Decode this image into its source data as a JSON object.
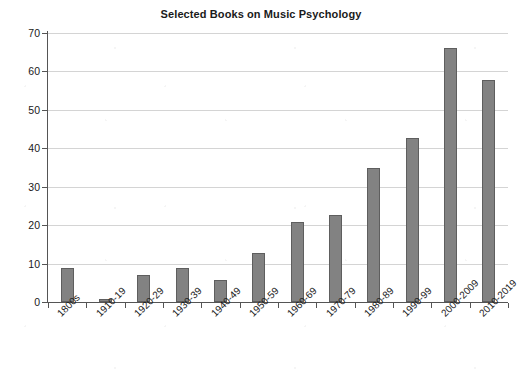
{
  "chart_data": {
    "type": "bar",
    "title": "Selected Books on Music Psychology",
    "xlabel": "",
    "ylabel": "",
    "categories": [
      "1800s",
      "1910-19",
      "1920-29",
      "1930-39",
      "1940-49",
      "1950-59",
      "1960-69",
      "1970-79",
      "1980-89",
      "1990-99",
      "2000-2009",
      "2010-2019"
    ],
    "values": [
      8.8,
      0.8,
      7.0,
      8.9,
      5.7,
      12.8,
      20.8,
      22.6,
      34.8,
      42.7,
      66.0,
      57.7
    ],
    "ylim": [
      0,
      70
    ],
    "ytick_labels": [
      "0",
      "10",
      "20",
      "30",
      "40",
      "50",
      "60",
      "70"
    ],
    "ytick_values": [
      0,
      10,
      20,
      30,
      40,
      50,
      60,
      70
    ],
    "grid": true,
    "legend": false,
    "bar_color": "#828282",
    "bar_edge_color": "#5e5e5e",
    "grid_color": "#d4d4d4",
    "axis_color": "#555555",
    "text_color": "#1a1a1a"
  }
}
